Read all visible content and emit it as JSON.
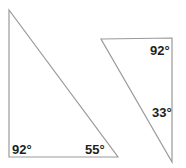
{
  "figure": {
    "background_color": "#ffffff",
    "stroke_color": "#9a9a9a",
    "text_color": "#231f20",
    "width": 186,
    "height": 168
  },
  "shapes": {
    "left_triangle": {
      "name": "left-triangle",
      "points": "9,10 9,157 118,157",
      "labels": [
        {
          "id": "bottom-left-angle",
          "value": "92°"
        },
        {
          "id": "bottom-right-angle",
          "value": "55°"
        }
      ]
    },
    "right_triangle": {
      "name": "right-triangle",
      "points": "101,39 172,38 172,162",
      "labels": [
        {
          "id": "top-right-angle",
          "value": "92°"
        },
        {
          "id": "bottom-right-angle",
          "value": "33°"
        }
      ]
    }
  },
  "labels": {
    "left_bottom_left": "92°",
    "left_bottom_right": "55°",
    "right_top_right": "92°",
    "right_lower_right": "33°"
  }
}
